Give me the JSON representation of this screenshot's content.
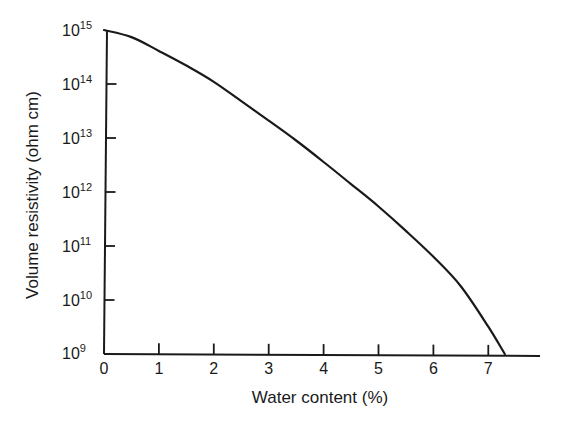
{
  "chart_data": {
    "type": "line",
    "title": "",
    "xlabel": "Water content (%)",
    "ylabel": "Volume resistivity (ohm cm)",
    "xlim": [
      0,
      7.9
    ],
    "ylim": [
      1000000000.0,
      1000000000000000.0
    ],
    "yscale": "log",
    "grid": false,
    "legend": null,
    "x_ticks": [
      "0",
      "1",
      "2",
      "3",
      "4",
      "5",
      "6",
      "7"
    ],
    "y_ticks": [
      {
        "base": "10",
        "exp": "15"
      },
      {
        "base": "10",
        "exp": "14"
      },
      {
        "base": "10",
        "exp": "13"
      },
      {
        "base": "10",
        "exp": "12"
      },
      {
        "base": "10",
        "exp": "11"
      },
      {
        "base": "10",
        "exp": "10"
      },
      {
        "base": "10",
        "exp": "9"
      }
    ],
    "series": [
      {
        "name": "Volume resistivity",
        "x": [
          0,
          0.5,
          1,
          1.5,
          2,
          2.5,
          3,
          3.5,
          4,
          4.5,
          5,
          5.5,
          6,
          6.5,
          7,
          7.3
        ],
        "y": [
          1000000000000000.0,
          740000000000000.0,
          410000000000000.0,
          220000000000000.0,
          110000000000000.0,
          48000000000000.0,
          21000000000000.0,
          9000000000000.0,
          3600000000000.0,
          1400000000000.0,
          540000000000.0,
          190000000000.0,
          63000000000.0,
          18000000000.0,
          3200000000.0,
          1000000000.0
        ],
        "color": "#1a1a1a"
      }
    ]
  },
  "axes": {
    "x_label": "Water content (%)",
    "y_label": "Volume resistivity (ohm cm)"
  }
}
